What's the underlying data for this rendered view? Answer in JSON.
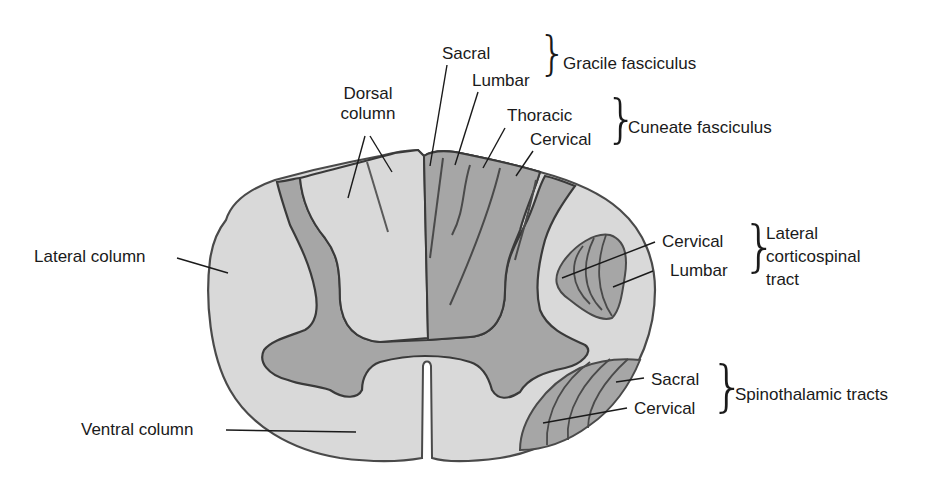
{
  "figure": {
    "colors": {
      "white_matter": "#d9d9d9",
      "gray_matter": "#a6a6a6",
      "outline": "#4a4a4a",
      "leader_line": "#1a1a1a",
      "text": "#1a1a1a"
    }
  },
  "labels": {
    "dorsal_column": [
      "Dorsal",
      "column"
    ],
    "lateral_column": "Lateral column",
    "ventral_column": "Ventral column",
    "gracile": {
      "parts": [
        "Sacral",
        "Lumbar"
      ],
      "group": "Gracile fasciculus"
    },
    "cuneate": {
      "parts": [
        "Thoracic",
        "Cervical"
      ],
      "group": "Cuneate fasciculus"
    },
    "lateral_corticospinal": {
      "parts": [
        "Cervical",
        "Lumbar"
      ],
      "group": [
        "Lateral",
        "corticospinal",
        "tract"
      ]
    },
    "spinothalamic": {
      "parts": [
        "Sacral",
        "Cervical"
      ],
      "group": "Spinothalamic tracts"
    }
  }
}
